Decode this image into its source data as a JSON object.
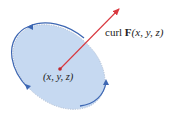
{
  "diagram": {
    "vector_label": {
      "prefix": "curl ",
      "bold": "F",
      "args": "(x, y, z)"
    },
    "point_label": "(x, y, z)",
    "colors": {
      "disk_fill": "#c6d9f1",
      "disk_edge": "#3d67b3",
      "vector": "#d9383f",
      "point": "#c0272d",
      "text": "#222222"
    },
    "elements": [
      {
        "name": "disk",
        "shape": "tilted ellipse",
        "center": [
          60,
          69
        ]
      },
      {
        "name": "curl-vector",
        "from": [
          60,
          69
        ],
        "to": [
          121,
          7
        ]
      },
      {
        "name": "circulation-arrows",
        "count": 3,
        "direction": "counterclockwise"
      }
    ]
  }
}
